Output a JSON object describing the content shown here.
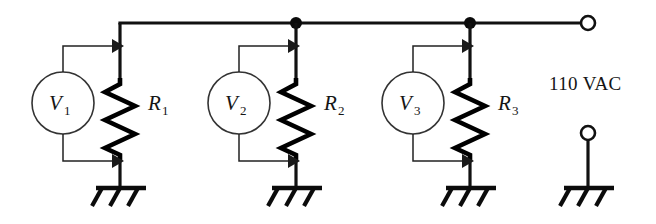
{
  "diagram": {
    "background_color": "#ffffff",
    "line_color": "#111111",
    "source": {
      "label": "110 VAC",
      "top_terminal_name": "line-terminal",
      "bottom_terminal_name": "neutral-terminal"
    },
    "branches": [
      {
        "meter_label": "V",
        "meter_subscript": "1",
        "resistor_label": "R",
        "resistor_subscript": "1",
        "ground_label": "ground"
      },
      {
        "meter_label": "V",
        "meter_subscript": "2",
        "resistor_label": "R",
        "resistor_subscript": "2",
        "ground_label": "ground"
      },
      {
        "meter_label": "V",
        "meter_subscript": "3",
        "resistor_label": "R",
        "resistor_subscript": "3",
        "ground_label": "ground"
      }
    ],
    "junction_dots": 2,
    "ground_symbols": 4
  }
}
